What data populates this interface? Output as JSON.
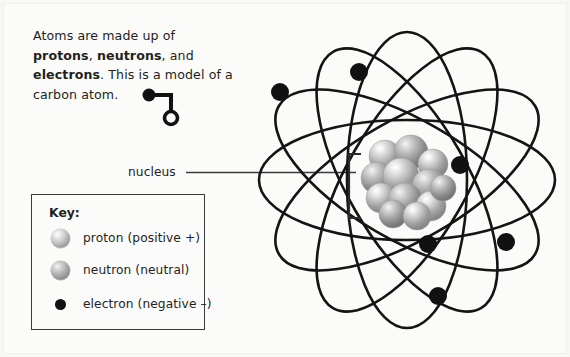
{
  "intro": {
    "line1_a": "Atoms are made up of ",
    "bold1": "protons",
    "line1_b": ", ",
    "bold2": "neutrons",
    "line1_c": ", and ",
    "bold3": "electrons",
    "line1_d": ". This is a model of a carbon atom."
  },
  "labels": {
    "nucleus": "nucleus"
  },
  "key": {
    "title": "Key:",
    "items": [
      {
        "icon": "proton-sphere-icon",
        "label": "proton (positive +)"
      },
      {
        "icon": "neutron-sphere-icon",
        "label": "neutron (neutral)"
      },
      {
        "icon": "electron-dot-icon",
        "label": "electron (negative –)"
      }
    ]
  },
  "colors": {
    "background": "#fbfbf9",
    "ink": "#231f20",
    "orbit_stroke": "#141414",
    "electron_fill": "#111111",
    "proton_light": "#e8e8e8",
    "proton_dark": "#8a8a8a",
    "neutron_light": "#d4d4d4",
    "neutron_dark": "#777777",
    "key_border": "#3a3a3a"
  },
  "chart_data": {
    "type": "diagram",
    "title": "Model of a carbon atom",
    "atom": {
      "element": "carbon",
      "electron_count": 6,
      "nucleus_particle_count": 12,
      "orbit_count": 6
    },
    "orbits": [
      {
        "rx": 148,
        "ry": 60,
        "rotation": 0
      },
      {
        "rx": 148,
        "ry": 60,
        "rotation": 30
      },
      {
        "rx": 148,
        "ry": 60,
        "rotation": 60
      },
      {
        "rx": 148,
        "ry": 60,
        "rotation": 90
      },
      {
        "rx": 148,
        "ry": 60,
        "rotation": 120
      },
      {
        "rx": 148,
        "ry": 60,
        "rotation": 150
      }
    ],
    "electrons": [
      {
        "id": "e1",
        "cx": 31,
        "cy": 84
      },
      {
        "id": "e2",
        "cx": 110,
        "cy": 64
      },
      {
        "id": "e3",
        "cx": 211,
        "cy": 157
      },
      {
        "id": "e4",
        "cx": 179,
        "cy": 236
      },
      {
        "id": "e5",
        "cx": 257,
        "cy": 234
      },
      {
        "id": "e6",
        "cx": 189,
        "cy": 288
      }
    ],
    "nucleus": {
      "cx": 158,
      "cy": 172,
      "particles": [
        {
          "cx": -22,
          "cy": -24,
          "r": 16,
          "type": "proton"
        },
        {
          "cx": 4,
          "cy": -28,
          "r": 17,
          "type": "neutron"
        },
        {
          "cx": 26,
          "cy": -16,
          "r": 15,
          "type": "proton"
        },
        {
          "cx": -30,
          "cy": -2,
          "r": 16,
          "type": "neutron"
        },
        {
          "cx": -6,
          "cy": -4,
          "r": 18,
          "type": "proton"
        },
        {
          "cx": 22,
          "cy": 6,
          "r": 17,
          "type": "neutron"
        },
        {
          "cx": -26,
          "cy": 18,
          "r": 15,
          "type": "proton"
        },
        {
          "cx": -2,
          "cy": 20,
          "r": 17,
          "type": "neutron"
        },
        {
          "cx": 24,
          "cy": 26,
          "r": 15,
          "type": "proton"
        },
        {
          "cx": -14,
          "cy": 34,
          "r": 14,
          "type": "neutron"
        },
        {
          "cx": 10,
          "cy": 36,
          "r": 14,
          "type": "proton"
        },
        {
          "cx": 36,
          "cy": 8,
          "r": 13,
          "type": "neutron"
        }
      ]
    }
  }
}
